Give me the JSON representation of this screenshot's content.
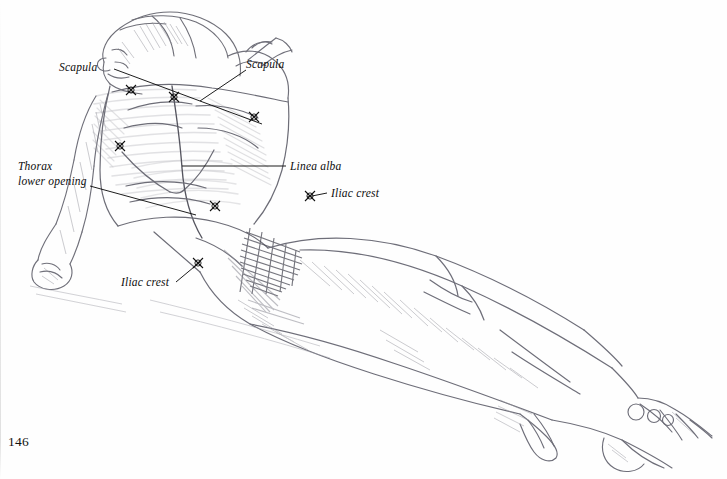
{
  "page": {
    "number": "146",
    "background_color": "#fefefe",
    "ink_color": "#0d0d0d",
    "pencil_color": "#8c8c93"
  },
  "figure": {
    "description_name": "reclining-nude-figure-pencil-drawing",
    "medium": "pencil"
  },
  "labels": [
    {
      "id": "scapula-left",
      "text": "Scapula",
      "line1": "Scapula",
      "line2": ""
    },
    {
      "id": "scapula-right",
      "text": "Scapula",
      "line1": "Scapula",
      "line2": ""
    },
    {
      "id": "thorax-lower-opening",
      "text": "Thorax lower opening",
      "line1": "Thorax",
      "line2": "lower opening"
    },
    {
      "id": "linea-alba",
      "text": "Linea alba",
      "line1": "Linea alba",
      "line2": ""
    },
    {
      "id": "iliac-crest-right",
      "text": "Iliac crest",
      "line1": "Iliac crest",
      "line2": ""
    },
    {
      "id": "iliac-crest-left",
      "text": "Iliac crest",
      "line1": "Iliac crest",
      "line2": ""
    }
  ]
}
